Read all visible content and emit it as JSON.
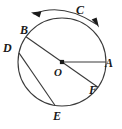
{
  "figure": {
    "background_color": "#ffffff",
    "stroke_color": "#3a3a3a",
    "label_color": "#1a1a1a",
    "circle": {
      "center_label": "O",
      "center_x": 62,
      "center_y": 62,
      "radius": 44
    },
    "points": [
      {
        "label": "A",
        "angle_deg": 0,
        "label_x": 105,
        "label_y": 57
      },
      {
        "label": "B",
        "angle_deg": 145,
        "label_x": 20,
        "label_y": 24
      },
      {
        "label": "D",
        "angle_deg": 168,
        "label_x": 3,
        "label_y": 42
      },
      {
        "label": "E",
        "angle_deg": 261,
        "label_x": 53,
        "label_y": 110
      },
      {
        "label": "F",
        "angle_deg": 325,
        "label_x": 89,
        "label_y": 84
      }
    ],
    "center_point_label": {
      "label": "O",
      "label_x": 54,
      "label_y": 66
    },
    "segments": [
      {
        "name": "radius-OA",
        "from": "O",
        "to": "A"
      },
      {
        "name": "diameter-BF",
        "from": "B",
        "to": "F"
      },
      {
        "name": "chord-DE",
        "from": "D",
        "to": "E"
      }
    ],
    "arc_arrow": {
      "label": "C",
      "label_x": 76,
      "label_y": 4,
      "direction": "double-headed",
      "arrowhead_left": true,
      "arrowhead_right": true
    }
  }
}
